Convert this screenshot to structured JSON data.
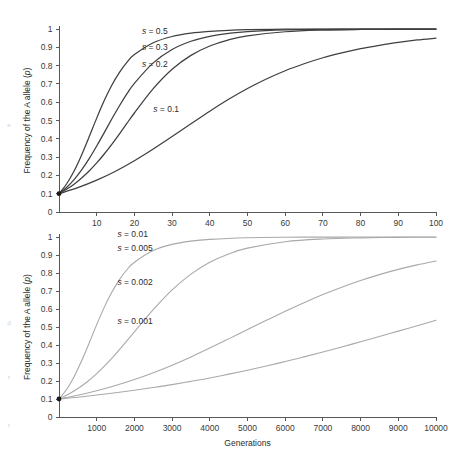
{
  "figure": {
    "background": "#ffffff",
    "width": 462,
    "height": 458
  },
  "margin_ghost_text": {
    "line1": "n",
    "line2": "d",
    "line3": "r",
    "line4": "t"
  },
  "chart_data": [
    {
      "id": "panel-top",
      "type": "line",
      "title": "",
      "xlabel": "",
      "ylabel": "Frequency of the A allele (p)",
      "ylabel_plain": "Frequency of the A allele",
      "ylabel_italic_part": "p",
      "xlim": [
        0,
        100
      ],
      "ylim": [
        0,
        1
      ],
      "grid": false,
      "legend_position": "inline-annotations",
      "xticks": [
        0,
        10,
        20,
        30,
        40,
        50,
        60,
        70,
        80,
        90,
        100
      ],
      "xticklabels": [
        "",
        "10",
        "20",
        "30",
        "40",
        "50",
        "60",
        "70",
        "80",
        "90",
        "100"
      ],
      "yticks": [
        0,
        0.1,
        0.2,
        0.3,
        0.4,
        0.5,
        0.6,
        0.7,
        0.8,
        0.9,
        1
      ],
      "yticklabels": [
        "0",
        "0.1",
        "0.2",
        "0.3",
        "0.4",
        "0.5",
        "0.6",
        "0.7",
        "0.8",
        "0.9",
        "1"
      ],
      "curve_color": "#3f3f3f",
      "curve_width": 1.25,
      "initial_frequency": 0.1,
      "series": [
        {
          "name": "s = 0.5",
          "s": 0.5,
          "label_x": 22,
          "label_y": 0.975,
          "x": [
            0,
            2,
            4,
            6,
            8,
            10,
            12,
            14,
            16,
            18,
            20,
            25,
            30,
            35,
            40,
            45,
            50,
            60,
            70,
            80,
            90,
            100
          ],
          "values": [
            0.1,
            0.153,
            0.224,
            0.312,
            0.411,
            0.513,
            0.609,
            0.693,
            0.762,
            0.818,
            0.86,
            0.925,
            0.959,
            0.977,
            0.987,
            0.993,
            0.996,
            0.999,
            0.9994,
            0.9996,
            0.9997,
            0.9998
          ]
        },
        {
          "name": "s = 0.3",
          "s": 0.3,
          "label_x": 22,
          "label_y": 0.885,
          "x": [
            0,
            2,
            4,
            6,
            8,
            10,
            12,
            14,
            16,
            18,
            20,
            25,
            30,
            35,
            40,
            45,
            50,
            60,
            70,
            80,
            90,
            100
          ],
          "values": [
            0.1,
            0.134,
            0.177,
            0.23,
            0.292,
            0.361,
            0.434,
            0.508,
            0.579,
            0.645,
            0.703,
            0.815,
            0.888,
            0.933,
            0.96,
            0.976,
            0.986,
            0.995,
            0.998,
            0.9992,
            0.9995,
            0.9997
          ]
        },
        {
          "name": "s = 0.2",
          "s": 0.2,
          "label_x": 22,
          "label_y": 0.79,
          "x": [
            0,
            2,
            4,
            6,
            8,
            10,
            12,
            14,
            16,
            18,
            20,
            25,
            30,
            35,
            40,
            45,
            50,
            60,
            70,
            80,
            90,
            100
          ],
          "values": [
            0.1,
            0.124,
            0.152,
            0.186,
            0.224,
            0.268,
            0.317,
            0.37,
            0.426,
            0.484,
            0.541,
            0.674,
            0.78,
            0.856,
            0.907,
            0.941,
            0.963,
            0.985,
            0.994,
            0.9975,
            0.999,
            0.9995
          ]
        },
        {
          "name": "s = 0.1",
          "s": 0.1,
          "label_x": 25,
          "label_y": 0.545,
          "x": [
            0,
            5,
            10,
            15,
            20,
            25,
            30,
            35,
            40,
            45,
            50,
            55,
            60,
            65,
            70,
            75,
            80,
            85,
            90,
            95,
            100
          ],
          "values": [
            0.1,
            0.133,
            0.174,
            0.223,
            0.28,
            0.344,
            0.412,
            0.482,
            0.551,
            0.616,
            0.675,
            0.727,
            0.772,
            0.81,
            0.843,
            0.87,
            0.893,
            0.911,
            0.927,
            0.94,
            0.95
          ]
        }
      ]
    },
    {
      "id": "panel-bottom",
      "type": "line",
      "title": "",
      "xlabel": "Generations",
      "ylabel": "Frequency of the A allele (p)",
      "ylabel_plain": "Frequency of the A allele",
      "ylabel_italic_part": "p",
      "xlim": [
        0,
        10000
      ],
      "ylim": [
        0,
        1
      ],
      "grid": false,
      "legend_position": "inline-annotations",
      "xticks": [
        0,
        1000,
        2000,
        3000,
        4000,
        5000,
        6000,
        7000,
        8000,
        9000,
        10000
      ],
      "xticklabels": [
        "",
        "1000",
        "2000",
        "3000",
        "4000",
        "5000",
        "6000",
        "7000",
        "8000",
        "9000",
        "10000"
      ],
      "yticks": [
        0,
        0.1,
        0.2,
        0.3,
        0.4,
        0.5,
        0.6,
        0.7,
        0.8,
        0.9,
        1
      ],
      "yticklabels": [
        "0",
        "0.1",
        "0.2",
        "0.3",
        "0.4",
        "0.5",
        "0.6",
        "0.7",
        "0.8",
        "0.9",
        "1"
      ],
      "curve_color": "#a9a9a9",
      "curve_width": 1.1,
      "initial_frequency": 0.1,
      "series": [
        {
          "name": "s = 0.01",
          "s": 0.01,
          "label_x": 1550,
          "label_y": 1.0,
          "x": [
            0,
            200,
            400,
            600,
            800,
            1000,
            1200,
            1400,
            1600,
            1800,
            2000,
            2500,
            3000,
            3500,
            4000,
            5000,
            6000,
            7000,
            8000,
            9000,
            10000
          ],
          "values": [
            0.1,
            0.153,
            0.224,
            0.312,
            0.411,
            0.513,
            0.609,
            0.693,
            0.762,
            0.818,
            0.86,
            0.925,
            0.959,
            0.977,
            0.987,
            0.996,
            0.999,
            0.9994,
            0.9996,
            0.9997,
            0.9998
          ]
        },
        {
          "name": "s = 0.005",
          "s": 0.005,
          "label_x": 1550,
          "label_y": 0.925,
          "x": [
            0,
            250,
            500,
            750,
            1000,
            1250,
            1500,
            1750,
            2000,
            2250,
            2500,
            3000,
            3500,
            4000,
            4500,
            5000,
            6000,
            7000,
            8000,
            9000,
            10000
          ],
          "values": [
            0.1,
            0.126,
            0.158,
            0.196,
            0.241,
            0.292,
            0.349,
            0.41,
            0.473,
            0.536,
            0.597,
            0.706,
            0.794,
            0.86,
            0.906,
            0.938,
            0.974,
            0.989,
            0.995,
            0.998,
            0.999
          ]
        },
        {
          "name": "s = 0.002",
          "s": 0.002,
          "label_x": 1550,
          "label_y": 0.735,
          "x": [
            0,
            500,
            1000,
            1500,
            2000,
            2500,
            3000,
            3500,
            4000,
            4500,
            5000,
            5500,
            6000,
            6500,
            7000,
            7500,
            8000,
            8500,
            9000,
            9500,
            10000
          ],
          "values": [
            0.1,
            0.121,
            0.146,
            0.175,
            0.208,
            0.246,
            0.288,
            0.334,
            0.383,
            0.434,
            0.486,
            0.537,
            0.587,
            0.635,
            0.68,
            0.721,
            0.758,
            0.791,
            0.82,
            0.845,
            0.867
          ]
        },
        {
          "name": "s = 0.001",
          "s": 0.001,
          "label_x": 1550,
          "label_y": 0.515,
          "x": [
            0,
            500,
            1000,
            1500,
            2000,
            2500,
            3000,
            3500,
            4000,
            4500,
            5000,
            5500,
            6000,
            6500,
            7000,
            7500,
            8000,
            8500,
            9000,
            9500,
            10000
          ],
          "values": [
            0.1,
            0.11,
            0.122,
            0.135,
            0.149,
            0.164,
            0.18,
            0.198,
            0.217,
            0.238,
            0.26,
            0.283,
            0.308,
            0.334,
            0.361,
            0.389,
            0.418,
            0.447,
            0.477,
            0.507,
            0.537
          ]
        }
      ]
    }
  ]
}
